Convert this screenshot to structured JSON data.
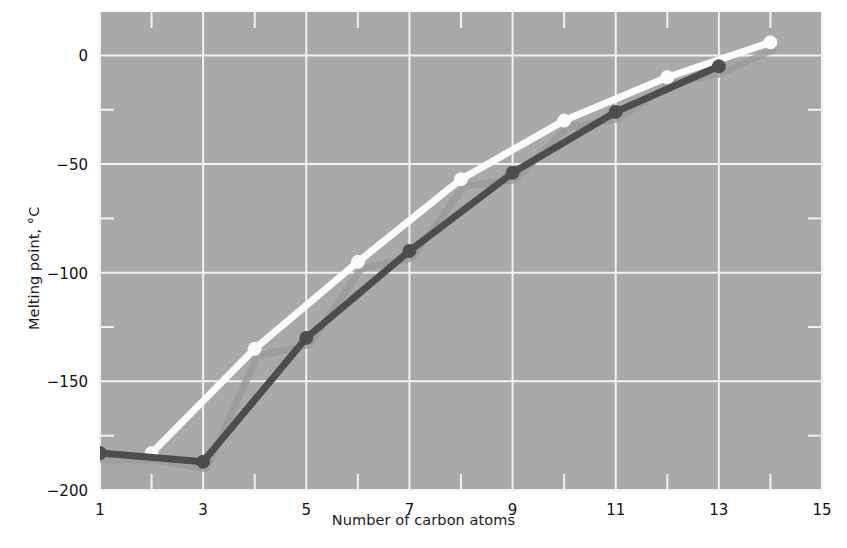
{
  "chart_data": {
    "type": "line",
    "title": "",
    "xlabel": "Number of carbon atoms",
    "ylabel": "Melting point, °C",
    "xlim": [
      1,
      15
    ],
    "ylim": [
      -200,
      20
    ],
    "grid": true,
    "legend_position": "none",
    "x_ticks": [
      1,
      3,
      5,
      7,
      9,
      11,
      13,
      15
    ],
    "x_tick_labels": [
      "1",
      "3",
      "5",
      "7",
      "9",
      "11",
      "13",
      "15"
    ],
    "x_minor_ticks": [
      2,
      4,
      6,
      8,
      10,
      12,
      14
    ],
    "y_ticks": [
      0,
      -50,
      -100,
      -150,
      -200
    ],
    "y_tick_labels": [
      "0",
      "-50",
      "-100",
      "-150",
      "-200"
    ],
    "y_minor_ticks": [
      -25,
      -75,
      -125,
      -175
    ],
    "background_color": "#a9a9a9",
    "gridline_color": "#f2f2f2",
    "series": [
      {
        "name": "even-numbered carbon atoms",
        "color": "#fbfbfb",
        "marker": "circle",
        "x": [
          2,
          4,
          6,
          8,
          10,
          12,
          14
        ],
        "values": [
          -183,
          -135,
          -95,
          -57,
          -30,
          -10,
          6
        ]
      },
      {
        "name": "odd-numbered carbon atoms",
        "color": "#4d4d4d",
        "marker": "circle",
        "x": [
          1,
          3,
          5,
          7,
          9,
          11,
          13
        ],
        "values": [
          -183,
          -187,
          -130,
          -90,
          -54,
          -26,
          -5
        ]
      }
    ]
  },
  "axes": {
    "x_title": "Number of carbon atoms",
    "y_title": "Melting point, °C"
  }
}
